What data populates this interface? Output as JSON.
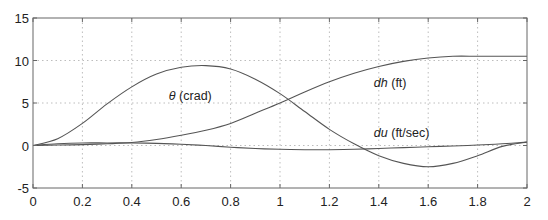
{
  "chart_data": {
    "type": "line",
    "title": "",
    "xlabel": "",
    "ylabel": "",
    "xlim": [
      0,
      2
    ],
    "ylim": [
      -5,
      15
    ],
    "grid": true,
    "legend": "none (inline annotations)",
    "x_ticks": [
      0,
      0.2,
      0.4,
      0.6,
      0.8,
      1,
      1.2,
      1.4,
      1.6,
      1.8,
      2
    ],
    "x_tick_labels": [
      "0",
      "0.2",
      "0.4",
      "0.6",
      "0.8",
      "1",
      "1.2",
      "1.4",
      "1.6",
      "1.8",
      "2"
    ],
    "y_ticks": [
      -5,
      0,
      5,
      10,
      15
    ],
    "y_tick_labels": [
      "-5",
      "0",
      "5",
      "10",
      "15"
    ],
    "x": [
      0,
      0.1,
      0.2,
      0.3,
      0.4,
      0.5,
      0.6,
      0.7,
      0.8,
      0.9,
      1.0,
      1.1,
      1.2,
      1.3,
      1.4,
      1.5,
      1.6,
      1.7,
      1.8,
      1.9,
      2.0
    ],
    "series": [
      {
        "name": "theta (crad)",
        "values": [
          0,
          0.8,
          2.6,
          4.9,
          6.9,
          8.4,
          9.2,
          9.4,
          9.0,
          7.8,
          6.1,
          4.0,
          1.9,
          0.2,
          -1.2,
          -2.1,
          -2.5,
          -2.1,
          -1.2,
          -0.1,
          0.4
        ]
      },
      {
        "name": "dh (ft)",
        "values": [
          0,
          0.05,
          0.1,
          0.2,
          0.35,
          0.7,
          1.2,
          1.8,
          2.6,
          3.8,
          5.0,
          6.3,
          7.5,
          8.5,
          9.3,
          9.9,
          10.3,
          10.5,
          10.5,
          10.5,
          10.5
        ]
      },
      {
        "name": "du (ft/sec)",
        "values": [
          0,
          0.2,
          0.3,
          0.3,
          0.3,
          0.25,
          0.15,
          0.0,
          -0.2,
          -0.35,
          -0.45,
          -0.5,
          -0.5,
          -0.45,
          -0.35,
          -0.25,
          -0.15,
          -0.05,
          0.05,
          0.2,
          0.4
        ]
      }
    ],
    "annotations": [
      {
        "symbol": "θ",
        "text": " (crad)",
        "x": 0.55,
        "y": 5.3
      },
      {
        "symbol": "dh",
        "text": " (ft)",
        "x": 1.38,
        "y": 6.9
      },
      {
        "symbol": "du",
        "text": " (ft/sec)",
        "x": 1.38,
        "y": 1.0
      }
    ]
  }
}
